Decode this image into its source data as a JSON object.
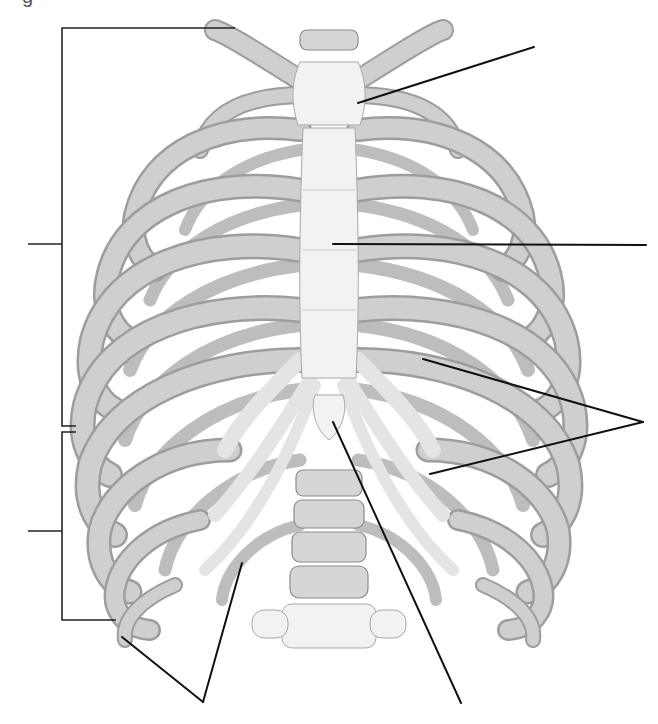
{
  "figure": {
    "caption_fragment": "g",
    "labels_visible": false,
    "colors": {
      "background": "#ffffff",
      "bone": "#e9e9e9",
      "bone_shadow": "#9a9a9a",
      "leader_line": "#111111"
    }
  },
  "brackets": [
    {
      "id": "true-ribs-bracket",
      "side": "left",
      "x": 62,
      "y_top": 28,
      "y_bottom": 426,
      "top_arm_end_x": 235,
      "bottom_arm_end_x": 62,
      "tick_y": 244,
      "tick_x_start": 28,
      "label": ""
    },
    {
      "id": "false-ribs-bracket",
      "side": "left",
      "x": 62,
      "y_top": 432,
      "y_bottom": 620,
      "top_arm_end_x": 76,
      "bottom_arm_end_x": 116,
      "tick_y": 531,
      "tick_x_start": 28,
      "label": ""
    }
  ],
  "leaders": [
    {
      "id": "manubrium-leader",
      "from": [
        358,
        103
      ],
      "to": [
        534,
        47
      ],
      "label": ""
    },
    {
      "id": "sternum-body-leader",
      "from": [
        333,
        244
      ],
      "to": [
        646,
        245
      ],
      "label": ""
    },
    {
      "id": "costal-cartilage-leader-1",
      "from": [
        423,
        359
      ],
      "to": [
        643,
        422
      ],
      "label": ""
    },
    {
      "id": "costal-cartilage-leader-2",
      "from": [
        430,
        474
      ],
      "to": [
        643,
        422
      ],
      "label": ""
    },
    {
      "id": "floating-rib-leader-1",
      "from": [
        122,
        637
      ],
      "to": [
        203,
        702
      ],
      "label": ""
    },
    {
      "id": "floating-rib-leader-2",
      "from": [
        242,
        563
      ],
      "to": [
        203,
        702
      ],
      "label": ""
    },
    {
      "id": "xiphoid-leader",
      "from": [
        333,
        422
      ],
      "to": [
        461,
        703
      ],
      "label": ""
    }
  ]
}
